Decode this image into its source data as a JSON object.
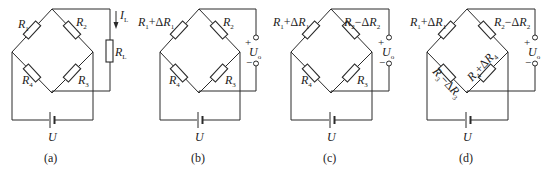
{
  "figure": {
    "panels": [
      {
        "id": "a",
        "caption": "(a)",
        "source_label": "U",
        "resistors": {
          "top_left": "R1",
          "top_right": "R2",
          "bottom_left": "R4",
          "bottom_right": "R3"
        },
        "load": {
          "resistor": "RL",
          "current": "IL"
        }
      },
      {
        "id": "b",
        "caption": "(b)",
        "source_label": "U",
        "resistors": {
          "top_left": "R1+ΔR1",
          "top_right": "R2",
          "bottom_left": "R4",
          "bottom_right": "R3"
        },
        "output": {
          "label": "Uo",
          "plus": "+",
          "minus": "−"
        }
      },
      {
        "id": "c",
        "caption": "(c)",
        "source_label": "U",
        "resistors": {
          "top_left": "R1+ΔR1",
          "top_right": "R2−ΔR2",
          "bottom_left": "R4",
          "bottom_right": "R3"
        },
        "output": {
          "label": "Uo",
          "plus": "+",
          "minus": "−"
        }
      },
      {
        "id": "d",
        "caption": "(d)",
        "source_label": "U",
        "resistors": {
          "top_left": "R1+ΔR1",
          "top_right": "R2−ΔR2",
          "bottom_left": "R3−ΔR3",
          "bottom_right": "R4+ΔR4"
        },
        "output": {
          "label": "Uo",
          "plus": "+",
          "minus": "−"
        }
      }
    ]
  }
}
